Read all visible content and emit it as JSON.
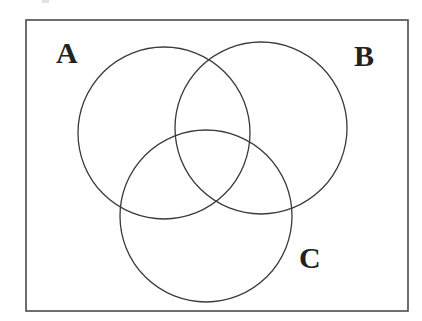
{
  "figure": {
    "type": "venn-diagram",
    "background_color": "#ffffff",
    "stroke_color": "#3a3a3a",
    "stroke_width": 1.3,
    "fill": "none",
    "width": 422,
    "height": 321
  },
  "universe": {
    "name": "universal-set-rectangle",
    "x": 26,
    "y": 20,
    "width": 382,
    "height": 291,
    "stroke_color": "#4a4a4a",
    "stroke_width": 1.6
  },
  "sets": [
    {
      "id": "A",
      "label": "A",
      "cx": 164,
      "cy": 133,
      "r": 86,
      "label_x": 56,
      "label_y": 38
    },
    {
      "id": "B",
      "label": "B",
      "cx": 261,
      "cy": 128,
      "r": 86,
      "label_x": 354,
      "label_y": 41
    },
    {
      "id": "C",
      "label": "C",
      "cx": 206,
      "cy": 216,
      "r": 86,
      "label_x": 299,
      "label_y": 243
    }
  ],
  "artifacts": {
    "top_edge_speck": {
      "description": "faint cropped speck at top edge",
      "x": 42,
      "y": 0,
      "width": 7,
      "height": 3,
      "color": "#d8d8d8"
    }
  }
}
